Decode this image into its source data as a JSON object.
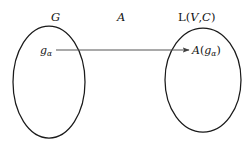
{
  "figure": {
    "background_color": "#ffffff",
    "stroke_color": "#1a1a1a",
    "arrow_color": "#4d4d4d",
    "text_color": "#131313"
  },
  "labels": {
    "domain_set": "G",
    "map_operator": "A",
    "codomain_set_prefix": "L",
    "codomain_open_paren": "(",
    "codomain_arg1": "V",
    "codomain_comma": ",",
    "codomain_arg2": "C",
    "codomain_close_paren": ")",
    "element_symbol": "g",
    "element_subscript": "α",
    "image_operator": "A",
    "image_open_paren": "(",
    "image_symbol": "g",
    "image_subscript": "α",
    "image_close_paren": ")"
  },
  "shapes": {
    "left_ellipse": {
      "cx": 49,
      "cy": 82,
      "rx": 36,
      "ry": 56
    },
    "right_ellipse": {
      "cx": 203,
      "cy": 80,
      "rx": 38,
      "ry": 52
    },
    "arrow": {
      "x1": 56,
      "y1": 50,
      "x2": 190,
      "y2": 50
    }
  }
}
